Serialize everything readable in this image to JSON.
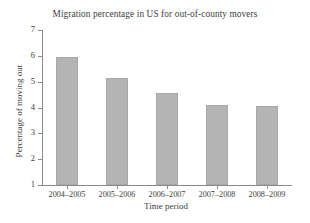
{
  "chart_data": {
    "type": "bar",
    "title": "Migration percentage in US for out-of-county movers",
    "xlabel": "Time period",
    "ylabel": "Percentage of moving out",
    "categories": [
      "2004–2005",
      "2005–2006",
      "2006–2007",
      "2007–2008",
      "2008–2009"
    ],
    "values": [
      5.95,
      5.15,
      4.57,
      4.09,
      4.06
    ],
    "ylim": [
      1,
      7
    ],
    "yticks": [
      1,
      2,
      3,
      4,
      5,
      6,
      7
    ],
    "ytick_labels": [
      "1",
      "2",
      "3",
      "4",
      "5",
      "6",
      "7"
    ],
    "grid": false,
    "legend": null,
    "bar_color": "#b4b4b4",
    "bar_edge_color": "#a8a8a8",
    "axis_color": "#8a8a8a",
    "text_color": "#3d3d3d",
    "background": "#ffffff"
  }
}
